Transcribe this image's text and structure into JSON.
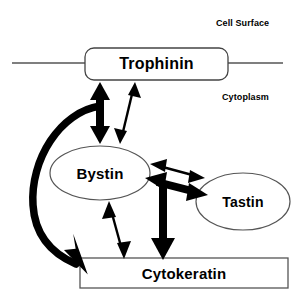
{
  "diagram": {
    "type": "biological-interaction-diagram",
    "background_color": "#ffffff",
    "stroke_color": "#000000",
    "membrane_line_color": "#555555",
    "regions": [
      {
        "id": "cell_surface",
        "label": "Cell Surface"
      },
      {
        "id": "cytoplasm",
        "label": "Cytoplasm"
      }
    ],
    "nodes": [
      {
        "id": "trophinin",
        "label": "Trophinin",
        "shape": "rounded-rect",
        "location": "membrane",
        "x": 85,
        "y": 48,
        "width": 143,
        "height": 32
      },
      {
        "id": "bystin",
        "label": "Bystin",
        "shape": "ellipse",
        "location": "cytoplasm",
        "x": 50,
        "y": 146,
        "width": 100,
        "height": 54
      },
      {
        "id": "tastin",
        "label": "Tastin",
        "shape": "ellipse",
        "location": "cytoplasm",
        "x": 196,
        "y": 173,
        "width": 94,
        "height": 57
      },
      {
        "id": "cytokeratin",
        "label": "Cytokeratin",
        "shape": "rect",
        "location": "cytoplasm",
        "x": 80,
        "y": 258,
        "width": 208,
        "height": 30
      }
    ],
    "edges": [
      {
        "id": "trophinin-bystin-thick",
        "from": "trophinin",
        "to": "bystin",
        "style": "thick",
        "arrow": "double"
      },
      {
        "id": "trophinin-bystin-thin",
        "from": "trophinin",
        "to": "bystin",
        "style": "thin",
        "arrow": "double"
      },
      {
        "id": "trophinin-cytokeratin-curved",
        "from": "trophinin",
        "to": "cytokeratin",
        "style": "thick-curved",
        "arrow": "single"
      },
      {
        "id": "bystin-tastin-thin",
        "from": "bystin",
        "to": "tastin",
        "style": "thin",
        "arrow": "double"
      },
      {
        "id": "bystin-tastin-thick",
        "from": "bystin",
        "to": "tastin",
        "style": "thick",
        "arrow": "double"
      },
      {
        "id": "bystin-tastin-cytokeratin-thick",
        "from": "bystin-tastin",
        "to": "cytokeratin",
        "style": "thick",
        "arrow": "single"
      },
      {
        "id": "bystin-cytokeratin-thin",
        "from": "bystin",
        "to": "cytokeratin",
        "style": "thin",
        "arrow": "double"
      }
    ],
    "membrane": {
      "left_segment": {
        "x1": 12,
        "x2": 85,
        "y": 63
      },
      "right_segment": {
        "x1": 228,
        "x2": 282,
        "y": 63
      }
    }
  }
}
